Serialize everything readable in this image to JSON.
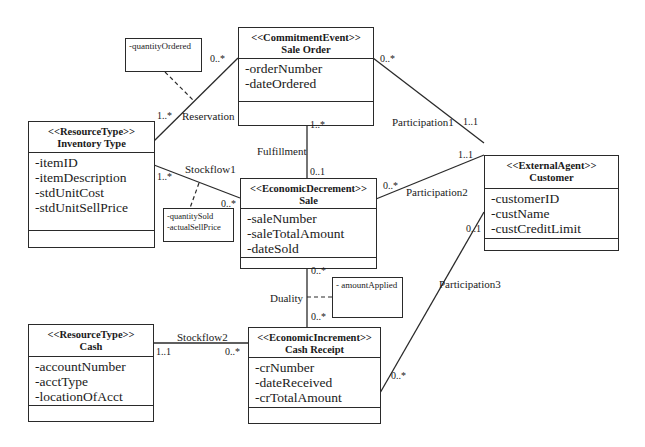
{
  "classes": {
    "sale_order": {
      "stereotype": "<<CommitmentEvent>>",
      "name": "Sale Order",
      "attributes": [
        "-orderNumber",
        "-dateOrdered"
      ]
    },
    "inventory_type": {
      "stereotype": "<<ResourceType>>",
      "name": "Inventory Type",
      "attributes": [
        "-itemID",
        "-itemDescription",
        "-stdUnitCost",
        "-stdUnitSellPrice"
      ]
    },
    "customer": {
      "stereotype": "<<ExternalAgent>>",
      "name": "Customer",
      "attributes": [
        "-customerID",
        "-custName",
        "-custCreditLimit"
      ]
    },
    "sale": {
      "stereotype": "<<EconomicDecrement>>",
      "name": "Sale",
      "attributes": [
        "-saleNumber",
        "-saleTotalAmount",
        "-dateSold"
      ]
    },
    "cash": {
      "stereotype": "<<ResourceType>>",
      "name": "Cash",
      "attributes": [
        "-accountNumber",
        "-acctType",
        "-locationOfAcct"
      ]
    },
    "cash_receipt": {
      "stereotype": "<<EconomicIncrement>>",
      "name": "Cash Receipt",
      "attributes": [
        "-crNumber",
        "-dateReceived",
        "-crTotalAmount"
      ]
    }
  },
  "notes": {
    "reservation": [
      "-quantityOrdered"
    ],
    "stockflow1": [
      "-quantitySold",
      "-actualSellPrice"
    ],
    "duality": [
      "- amountApplied"
    ]
  },
  "associations": {
    "reservation": {
      "label": "Reservation",
      "mult_inventory": "1..*",
      "mult_sale_order": "0..*"
    },
    "participation1": {
      "label": "Participation1",
      "mult_sale_order": "0..*",
      "mult_customer": "1..1"
    },
    "fulfillment": {
      "label": "Fulfillment",
      "mult_sale_order": "1..*",
      "mult_sale": "0..1"
    },
    "stockflow1": {
      "label": "Stockflow1",
      "mult_inventory": "1..*",
      "mult_sale": "0..*"
    },
    "participation2": {
      "label": "Participation2",
      "mult_sale": "0..*",
      "mult_customer": "1..1"
    },
    "duality": {
      "label": "Duality",
      "mult_sale": "0..*",
      "mult_cash_receipt": "0..*"
    },
    "participation3": {
      "label": "Participation3",
      "mult_customer": "0..1",
      "mult_cash_receipt": "0..*"
    },
    "stockflow2": {
      "label": "Stockflow2",
      "mult_cash": "1..1",
      "mult_cash_receipt": "0..*"
    }
  }
}
